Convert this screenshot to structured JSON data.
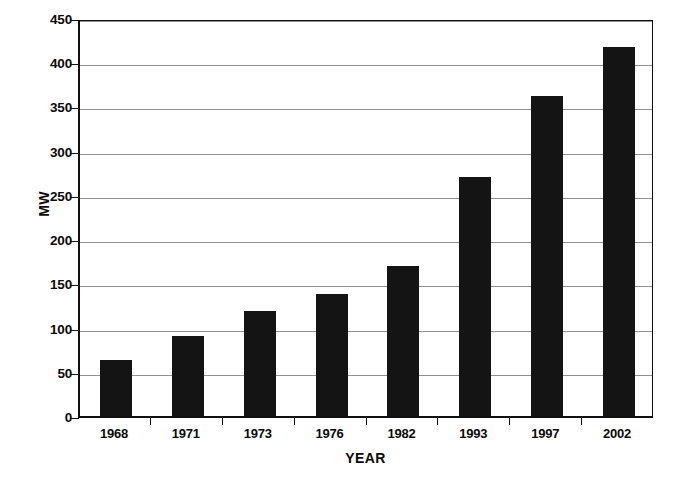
{
  "chart_data": {
    "type": "bar",
    "title": "",
    "subtitle": "",
    "xlabel": "YEAR",
    "ylabel": "MW",
    "categories": [
      "1968",
      "1971",
      "1973",
      "1976",
      "1982",
      "1993",
      "1997",
      "2002"
    ],
    "values": [
      63,
      90,
      119,
      138,
      170,
      270,
      362,
      417
    ],
    "series": [
      {
        "name": "MW",
        "values": [
          63,
          90,
          119,
          138,
          170,
          270,
          362,
          417
        ]
      }
    ],
    "ylim": [
      0,
      450
    ],
    "ytick_step": 50,
    "ytick_labels": [
      "0",
      "50",
      "100",
      "150",
      "200",
      "250",
      "300",
      "350",
      "400",
      "450"
    ],
    "ytick_values": [
      0,
      50,
      100,
      150,
      200,
      250,
      300,
      350,
      400,
      450
    ],
    "grid": "horizontal",
    "legend": "none",
    "bar_color": "#141414",
    "grid_color": "#909090",
    "axis_color": "#111111",
    "background_color": "#ffffff"
  },
  "axes": {
    "y_title": "MW",
    "x_title": "YEAR"
  },
  "caption": {
    "sliver_text": ""
  }
}
